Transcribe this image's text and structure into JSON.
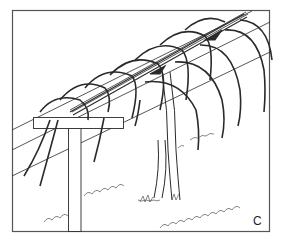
{
  "figure": {
    "panel_label": "C",
    "colors": {
      "ink": "#2a2a2a",
      "background": "#ffffff",
      "frame": "#555555"
    }
  }
}
